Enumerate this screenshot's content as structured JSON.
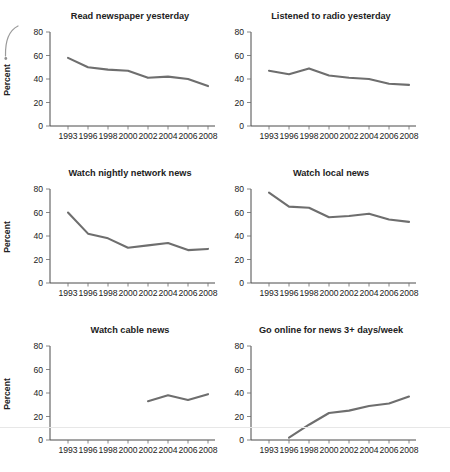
{
  "page": {
    "background": "#ffffff",
    "line_color": "#6e6e6e",
    "axis_color": "#4a4a4a",
    "text_color": "#222222",
    "artifact_color": "#9b9b9b"
  },
  "chart_data": [
    {
      "type": "line",
      "title": "Read newspaper yesterday",
      "xlabel": "",
      "ylabel": "Percent",
      "ylim": [
        0,
        80
      ],
      "yticks": [
        0,
        20,
        40,
        60,
        80
      ],
      "grid": false,
      "legend": null,
      "categories": [
        "1993",
        "1996",
        "1998",
        "2000",
        "2002",
        "2004",
        "2006",
        "2008"
      ],
      "values": [
        58,
        50,
        48,
        47,
        41,
        42,
        40,
        34
      ]
    },
    {
      "type": "line",
      "title": "Listened to radio yesterday",
      "xlabel": "",
      "ylabel": "",
      "ylim": [
        0,
        80
      ],
      "yticks": [
        0,
        20,
        40,
        60,
        80
      ],
      "grid": false,
      "legend": null,
      "categories": [
        "1993",
        "1996",
        "1998",
        "2000",
        "2002",
        "2004",
        "2006",
        "2008"
      ],
      "values": [
        47,
        44,
        49,
        43,
        41,
        40,
        36,
        35
      ]
    },
    {
      "type": "line",
      "title": "Watch nightly network news",
      "xlabel": "",
      "ylabel": "Percent",
      "ylim": [
        0,
        80
      ],
      "yticks": [
        0,
        20,
        40,
        60,
        80
      ],
      "grid": false,
      "legend": null,
      "categories": [
        "1993",
        "1996",
        "1998",
        "2000",
        "2002",
        "2004",
        "2006",
        "2008"
      ],
      "values": [
        60,
        42,
        38,
        30,
        32,
        34,
        28,
        29
      ]
    },
    {
      "type": "line",
      "title": "Watch local news",
      "xlabel": "",
      "ylabel": "",
      "ylim": [
        0,
        80
      ],
      "yticks": [
        0,
        20,
        40,
        60,
        80
      ],
      "grid": false,
      "legend": null,
      "categories": [
        "1993",
        "1996",
        "1998",
        "2000",
        "2002",
        "2004",
        "2006",
        "2008"
      ],
      "values": [
        77,
        65,
        64,
        56,
        57,
        59,
        54,
        52
      ]
    },
    {
      "type": "line",
      "title": "Watch cable news",
      "xlabel": "",
      "ylabel": "Percent",
      "ylim": [
        0,
        80
      ],
      "yticks": [
        0,
        20,
        40,
        60,
        80
      ],
      "grid": false,
      "legend": null,
      "categories": [
        "1993",
        "1996",
        "1998",
        "2000",
        "2002",
        "2004",
        "2006",
        "2008"
      ],
      "values": [
        null,
        null,
        null,
        null,
        33,
        38,
        34,
        39
      ]
    },
    {
      "type": "line",
      "title": "Go online for news 3+ days/week",
      "xlabel": "",
      "ylabel": "",
      "ylim": [
        0,
        80
      ],
      "yticks": [
        0,
        20,
        40,
        60,
        80
      ],
      "grid": false,
      "legend": null,
      "categories": [
        "1993",
        "1996",
        "1998",
        "2000",
        "2002",
        "2004",
        "2006",
        "2008"
      ],
      "values": [
        null,
        2,
        13,
        23,
        25,
        29,
        31,
        37
      ]
    }
  ]
}
